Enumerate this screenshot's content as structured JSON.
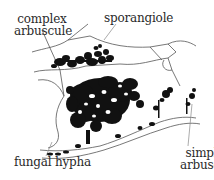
{
  "diagram": {
    "labels": {
      "complex_arbuscule_line1": "complex",
      "complex_arbuscule_line2": "arbuscule",
      "sporangiole": "sporangiole",
      "fungal_hypha": "fungal hypha",
      "simple_arbuscule_line1": "simple",
      "simple_arbuscule_line2": "arbuscule"
    },
    "colors": {
      "ink": "#111111",
      "cell_wall": "#555555",
      "leader_line": "#888888",
      "background": "#ffffff"
    }
  }
}
